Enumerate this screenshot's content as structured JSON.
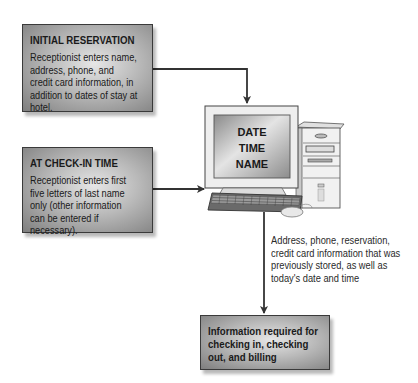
{
  "diagram": {
    "boxes": [
      {
        "id": "initial-reservation",
        "title": "INITIAL RESERVATION",
        "body": "Receptionist enters name, address, phone, and credit card information, in addition to dates of stay at hotel."
      },
      {
        "id": "check-in-time",
        "title": "AT CHECK-IN TIME",
        "body": "Receptionist enters first five letters of last name only (other information can be entered if necessary)."
      },
      {
        "id": "output",
        "body": "Information required for checking in, checking out, and billing"
      }
    ],
    "computer": {
      "screen_lines": [
        "DATE",
        "TIME",
        "NAME"
      ]
    },
    "note": "Address, phone, reservation, credit card information that was previously stored, as well as today's date and time",
    "colors": {
      "line": "#333333",
      "box_border": "#3a3a3a",
      "box_light": "#e6e6e6",
      "box_dark": "#7e7e7e"
    }
  }
}
